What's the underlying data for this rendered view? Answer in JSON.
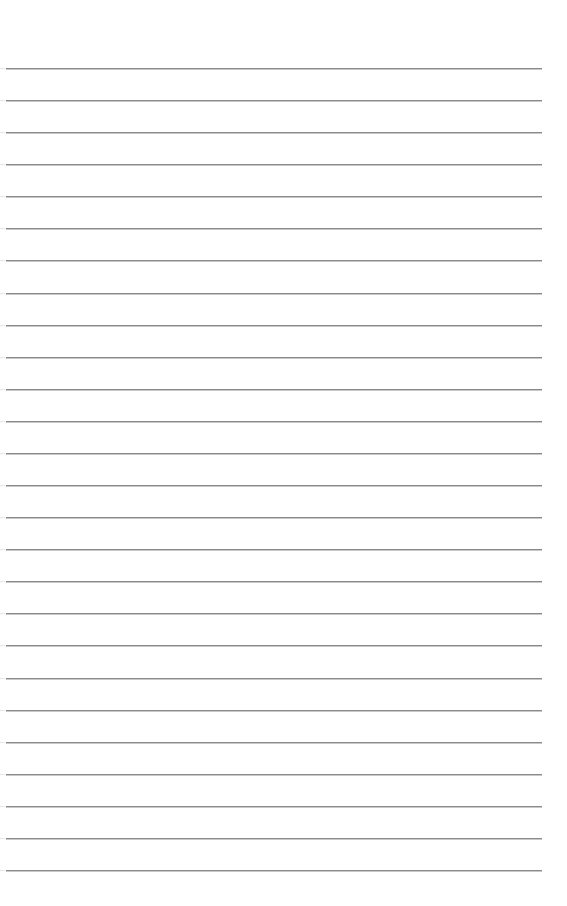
{
  "document": {
    "type": "lined-paper",
    "line_count": 26,
    "first_line_y": 68,
    "line_spacing": 32.08,
    "line_color": "#8a8a8a",
    "background_color": "#ffffff",
    "text": ""
  }
}
